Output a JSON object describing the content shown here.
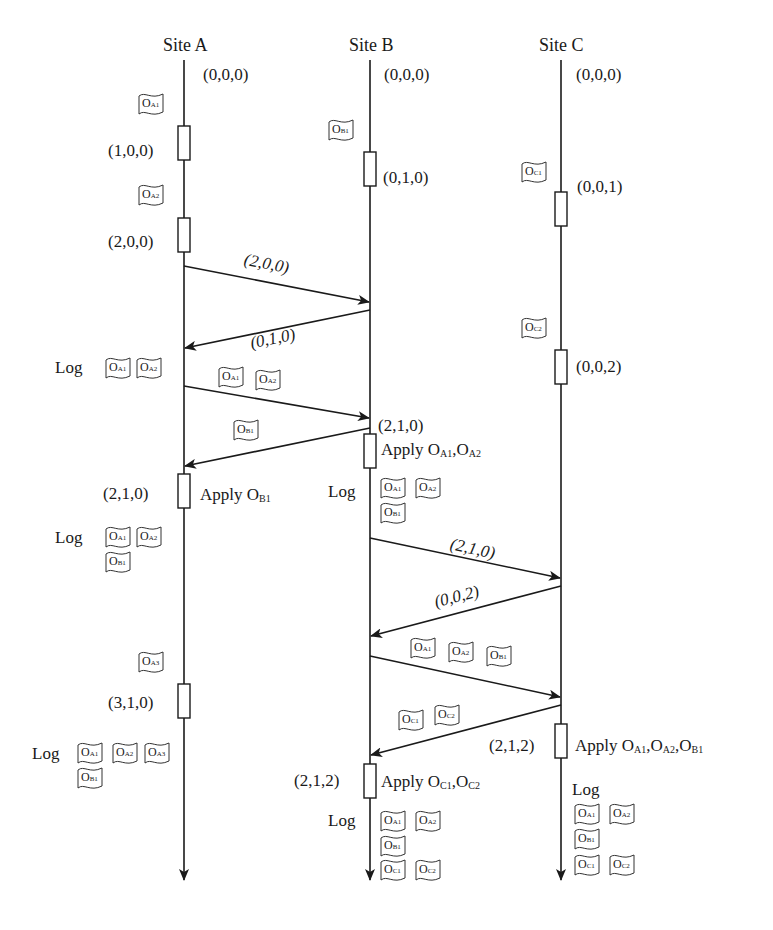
{
  "sites": [
    {
      "name": "Site A",
      "initial_clock": "(0,0,0)"
    },
    {
      "name": "Site B",
      "initial_clock": "(0,0,0)"
    },
    {
      "name": "Site C",
      "initial_clock": "(0,0,0)"
    }
  ],
  "site_a": {
    "clocks": [
      "(1,0,0)",
      "(2,0,0)",
      "(2,1,0)",
      "(3,1,0)"
    ],
    "apply": "Apply O",
    "apply_sub": "B1",
    "log_label": "Log"
  },
  "site_b": {
    "clocks": [
      "(0,1,0)",
      "(2,1,0)",
      "(2,1,2)"
    ],
    "apply1_prefix": "Apply O",
    "apply1_sub1": "A1",
    "apply1_mid": ",O",
    "apply1_sub2": "A2",
    "apply2_prefix": "Apply O",
    "apply2_sub1": "C1",
    "apply2_mid": ",O",
    "apply2_sub2": "C2",
    "log_label": "Log"
  },
  "site_c": {
    "clocks": [
      "(0,0,1)",
      "(0,0,2)",
      "(2,1,2)"
    ],
    "apply_prefix": "Apply O",
    "apply_sub1": "A1",
    "apply_mid1": ",O",
    "apply_sub2": "A2",
    "apply_mid2": ",O",
    "apply_sub3": "B1",
    "log_label": "Log"
  },
  "messages": [
    {
      "from": "Site A",
      "to": "Site B",
      "label": "(2,0,0)"
    },
    {
      "from": "Site B",
      "to": "Site A",
      "label": "(0,1,0)"
    },
    {
      "from": "Site A",
      "to": "Site B",
      "label": "O_A1, O_A2"
    },
    {
      "from": "Site B",
      "to": "Site A",
      "label": "O_B1"
    },
    {
      "from": "Site B",
      "to": "Site C",
      "label": "(2,1,0)"
    },
    {
      "from": "Site C",
      "to": "Site B",
      "label": "(0,0,2)"
    },
    {
      "from": "Site B",
      "to": "Site C",
      "label": "O_A1, O_A2, O_B1"
    },
    {
      "from": "Site C",
      "to": "Site B",
      "label": "O_C1, O_C2"
    }
  ],
  "ops": {
    "O": "O",
    "A1": "A1",
    "A2": "A2",
    "A3": "A3",
    "B1": "B1",
    "C1": "C1",
    "C2": "C2"
  }
}
